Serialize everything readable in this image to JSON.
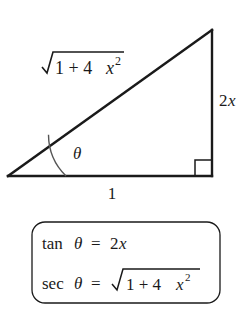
{
  "figure": {
    "background_color": "#ffffff",
    "stroke_color": "#1a1a1a",
    "triangle": {
      "vertices": {
        "left_label": "left vertex",
        "apex_label": "top-right apex",
        "corner_label": "bottom-right corner"
      },
      "labels": {
        "hypotenuse": {
          "radical": "√",
          "radicand_a": "1 + 4",
          "radicand_var": "x",
          "radicand_exp": "2",
          "plain": "√(1 + 4x²)"
        },
        "vertical_side": {
          "coefficient": "2",
          "variable": "x",
          "plain": "2x"
        },
        "base_side": {
          "value": "1"
        },
        "angle": {
          "symbol": "θ",
          "plain": "theta"
        }
      },
      "right_angle_marker": "right-angle-square"
    },
    "identity_box": {
      "border_color": "#1a1a1a",
      "corner_radius": "12",
      "lines": [
        {
          "function": "tan",
          "angle": "θ",
          "equals": "=",
          "coefficient": "2",
          "variable": "x",
          "plain": "tan θ = 2x"
        },
        {
          "function": "sec",
          "angle": "θ",
          "equals": "=",
          "radical": "√",
          "radicand_a": "1 + 4",
          "radicand_var": "x",
          "radicand_exp": "2",
          "plain": "sec θ = √(1 + 4x²)"
        }
      ]
    }
  }
}
